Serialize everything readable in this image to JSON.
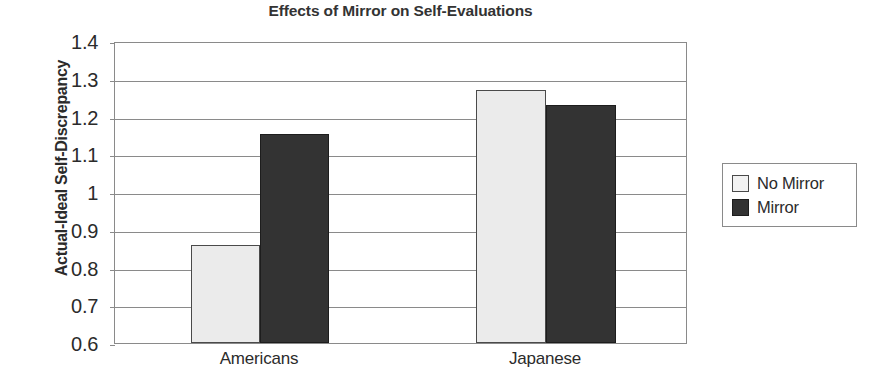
{
  "chart_data": {
    "type": "bar",
    "title": "Effects of Mirror on Self-Evaluations",
    "xlabel": "",
    "ylabel": "Actual-Ideal Self-Discrepancy",
    "categories": [
      "Americans",
      "Japanese"
    ],
    "series": [
      {
        "name": "No Mirror",
        "values": [
          0.86,
          1.27
        ],
        "color": "#ebebeb"
      },
      {
        "name": "Mirror",
        "values": [
          1.155,
          1.23
        ],
        "color": "#333333"
      }
    ],
    "ylim": [
      0.6,
      1.4
    ],
    "ytick_labels": [
      "1.4",
      "1.3",
      "1.2",
      "1.1",
      "1",
      "0.9",
      "0.8",
      "0.7",
      "0.6"
    ],
    "ytick_values": [
      1.4,
      1.3,
      1.2,
      1.1,
      1.0,
      0.9,
      0.8,
      0.7,
      0.6
    ],
    "grid": true,
    "legend_position": "right",
    "axis_color": "#8a8a8a",
    "text_color": "#2b2b2b"
  },
  "legend": {
    "items": [
      {
        "label": "No Mirror",
        "swatch": "light"
      },
      {
        "label": "Mirror",
        "swatch": "dark"
      }
    ]
  }
}
